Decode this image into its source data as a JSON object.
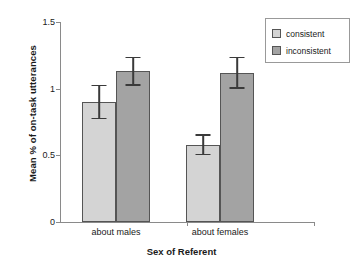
{
  "chart_data": {
    "type": "bar",
    "title": "",
    "xlabel": "Sex of Referent",
    "ylabel": "Mean % of on-task utterances",
    "categories": [
      "about males",
      "about females"
    ],
    "ylim": [
      0,
      1.5
    ],
    "yticks": [
      0,
      0.5,
      1,
      1.5
    ],
    "ytick_labels": [
      "0",
      "0.5",
      "1",
      "1.5"
    ],
    "grid": false,
    "legend_position": "top-right",
    "series": [
      {
        "name": "consistent",
        "color": "#d4d4d4",
        "values": [
          0.9,
          0.58
        ],
        "errors": [
          0.13,
          0.08
        ]
      },
      {
        "name": "inconsistent",
        "color": "#a3a3a3",
        "values": [
          1.13,
          1.12
        ],
        "errors": [
          0.11,
          0.12
        ]
      }
    ]
  },
  "legend": {
    "items": [
      {
        "label": "consistent"
      },
      {
        "label": "inconsistent"
      }
    ]
  }
}
